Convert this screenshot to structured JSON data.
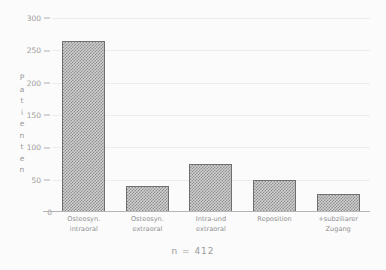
{
  "chart_data": {
    "type": "bar",
    "title": "",
    "subtitle": "",
    "xlabel": "",
    "ylabel": "Patienten",
    "categories": [
      "Osteosyn. intraoral",
      "Osteosyn. extraoral",
      "Intra-und extraoral",
      "Reposition",
      "+subziliarer Zugang"
    ],
    "category_lines": [
      {
        "line1": "Osteosyn.",
        "line2": "intraoral"
      },
      {
        "line1": "Osteosyn.",
        "line2": "extraoral"
      },
      {
        "line1": "Intra-und",
        "line2": "extraoral"
      },
      {
        "line1": "Reposition",
        "line2": ""
      },
      {
        "line1": "+subziliarer",
        "line2": "Zugang"
      }
    ],
    "values": [
      265,
      40,
      75,
      50,
      28
    ],
    "ylim": [
      0,
      300
    ],
    "ytick_values": [
      0,
      50,
      100,
      150,
      200,
      250,
      300
    ],
    "ytick_labels": [
      "0",
      "50",
      "100",
      "150",
      "200",
      "250",
      "300"
    ],
    "grid": true,
    "legend": "none",
    "annotations": [
      "n = 412"
    ],
    "bar_fill": "#8e8e8e",
    "bar_border": "#6f6f6f",
    "axis_color": "#b0b0b0",
    "text_color": "#9a9a9a",
    "background": "#fbfbfb"
  },
  "axis": {
    "y_title_letters": [
      "P",
      "a",
      "t",
      "i",
      "e",
      "n",
      "t",
      "e",
      "n"
    ]
  },
  "caption": {
    "text": "n = 412"
  }
}
